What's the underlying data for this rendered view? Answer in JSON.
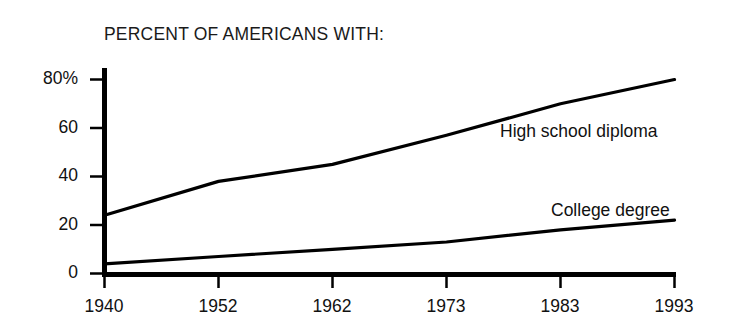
{
  "chart_data": {
    "type": "line",
    "title": "PERCENT OF AMERICANS WITH:",
    "xlabel": "",
    "ylabel": "",
    "x": [
      1940,
      1952,
      1962,
      1973,
      1983,
      1993
    ],
    "categories": [
      "1940",
      "1952",
      "1962",
      "1973",
      "1983",
      "1993"
    ],
    "xtick_labels": [
      "1940",
      "1952",
      "1962",
      "1973",
      "1983",
      "1993"
    ],
    "ytick_labels": [
      "0",
      "20",
      "40",
      "60",
      "80%"
    ],
    "ytick_values": [
      0,
      20,
      40,
      60,
      80
    ],
    "ylim": [
      0,
      85
    ],
    "grid": false,
    "legend_position": "inline-right-of-series",
    "series": [
      {
        "name": "High school diploma",
        "values": [
          24,
          38,
          45,
          57,
          70,
          80
        ],
        "color": "#000000",
        "label": "High school diploma"
      },
      {
        "name": "College degree",
        "values": [
          4,
          7,
          10,
          13,
          18,
          22
        ],
        "color": "#000000",
        "label": "College degree"
      }
    ],
    "annotations": [
      {
        "text": "High school diploma",
        "x": 1973,
        "y": 57
      },
      {
        "text": "College degree",
        "x": 1983,
        "y": 28
      }
    ]
  },
  "axis": {
    "y_ticks": [
      {
        "label": "80%",
        "value": 80
      },
      {
        "label": "60",
        "value": 60
      },
      {
        "label": "40",
        "value": 40
      },
      {
        "label": "20",
        "value": 20
      },
      {
        "label": "0",
        "value": 0
      }
    ],
    "x_ticks": [
      {
        "label": "1940",
        "value": 1940
      },
      {
        "label": "1952",
        "value": 1952
      },
      {
        "label": "1962",
        "value": 1962
      },
      {
        "label": "1973",
        "value": 1973
      },
      {
        "label": "1983",
        "value": 1983
      },
      {
        "label": "1993",
        "value": 1993
      }
    ]
  },
  "series_labels": {
    "high_school": "High school diploma",
    "college": "College degree"
  }
}
